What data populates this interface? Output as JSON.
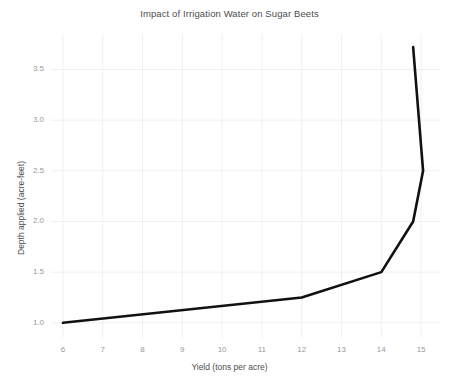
{
  "chart_data": {
    "type": "line",
    "title": "Impact of Irrigation Water on Sugar Beets",
    "xlabel": "Yield (tons per acre)",
    "ylabel": "Depth applied (acre-feet)",
    "xlim": [
      5.7,
      15.5
    ],
    "ylim": [
      0.85,
      3.85
    ],
    "xticks": [
      6,
      7,
      8,
      9,
      10,
      11,
      12,
      13,
      14,
      15
    ],
    "xtick_labels": [
      "6",
      "7",
      "8",
      "9",
      "10",
      "11",
      "12",
      "13",
      "14",
      "15"
    ],
    "yticks": [
      1.0,
      1.5,
      2.0,
      2.5,
      3.0,
      3.5
    ],
    "ytick_labels": [
      "1.0",
      "1.5",
      "2.0",
      "2.5",
      "3.0",
      "3.5"
    ],
    "grid": true,
    "grid_color": "#f0f0f0",
    "legend": null,
    "line_color": "#111111",
    "line_width": 2.6,
    "series": [
      {
        "name": "Depth applied vs yield",
        "x": [
          6.0,
          12.0,
          14.0,
          14.8,
          15.05,
          14.8
        ],
        "y": [
          1.0,
          1.25,
          1.5,
          2.0,
          2.5,
          3.72
        ]
      }
    ]
  },
  "figure": {
    "background_color": "#ffffff",
    "text_color": "#4d4d4d",
    "tick_color": "#999999"
  }
}
